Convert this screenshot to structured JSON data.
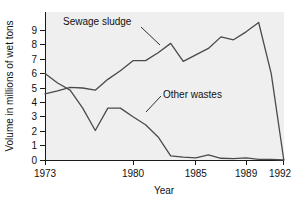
{
  "chart_data": {
    "type": "line",
    "title": "",
    "xlabel": "Year",
    "ylabel": "Volume in millions of wet tons",
    "xlim": [
      1973,
      1992
    ],
    "ylim": [
      0,
      9.6
    ],
    "grid": false,
    "legend_position": "inline-annotations",
    "x_ticks": [
      "1973",
      "1980",
      "1985",
      "1989",
      "1992"
    ],
    "x_tick_values": [
      1973,
      1980,
      1985,
      1989,
      1992
    ],
    "y_ticks": [
      "0",
      "1",
      "2",
      "3",
      "4",
      "5",
      "6",
      "7",
      "8",
      "9"
    ],
    "y_tick_values": [
      0,
      1,
      2,
      3,
      4,
      5,
      6,
      7,
      8,
      9
    ],
    "x": [
      1973,
      1974,
      1975,
      1976,
      1977,
      1978,
      1979,
      1980,
      1981,
      1982,
      1983,
      1984,
      1985,
      1986,
      1987,
      1988,
      1989,
      1990,
      1991,
      1992
    ],
    "series": [
      {
        "name": "Sewage sludge",
        "label": "Sewage sludge",
        "color": "#4a4a4a",
        "values": [
          4.6,
          4.8,
          5.05,
          5.0,
          4.85,
          5.6,
          6.2,
          6.9,
          6.9,
          7.45,
          8.1,
          6.85,
          7.3,
          7.75,
          8.55,
          8.35,
          8.9,
          9.55,
          6.0,
          0.0
        ]
      },
      {
        "name": "Other wastes",
        "label": "Other wastes",
        "color": "#4a4a4a",
        "values": [
          6.0,
          5.35,
          4.85,
          3.6,
          2.05,
          3.6,
          3.6,
          3.0,
          2.45,
          1.6,
          0.28,
          0.2,
          0.15,
          0.35,
          0.12,
          0.1,
          0.15,
          0.05,
          0.05,
          0.0
        ]
      }
    ],
    "annotations": [
      {
        "text": "Sewage sludge",
        "x": 1975.5,
        "y": 8.55
      },
      {
        "text": "Other wastes",
        "x": 1984.0,
        "y": 3.35
      }
    ]
  },
  "axes": {
    "y_title": "Volume in millions of wet tons",
    "x_title": "Year"
  }
}
